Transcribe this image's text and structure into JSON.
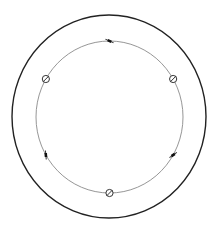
{
  "canvas": {
    "width": 219,
    "height": 229,
    "background": "#ffffff"
  },
  "outer_circle": {
    "cx": 109,
    "cy": 116.5,
    "rx": 97,
    "ry": 101.5,
    "stroke": "#222222",
    "stroke_width": 1.4
  },
  "inner_circle": {
    "cx": 109.5,
    "cy": 117,
    "rx": 73.5,
    "ry": 76,
    "stroke": "#8a8a8a",
    "stroke_width": 0.9
  },
  "markers": [
    {
      "type": "tick",
      "icon": "tick-mark-icon",
      "angle_deg": -90
    },
    {
      "type": "circle-slash",
      "icon": "circle-slash-icon",
      "angle_deg": -30
    },
    {
      "type": "tick",
      "icon": "tick-mark-icon",
      "angle_deg": 30
    },
    {
      "type": "circle-slash",
      "icon": "circle-slash-icon",
      "angle_deg": 90
    },
    {
      "type": "tick",
      "icon": "tick-mark-icon",
      "angle_deg": 150
    },
    {
      "type": "circle-slash",
      "icon": "circle-slash-icon",
      "angle_deg": 210
    }
  ],
  "marker_color": "#333333"
}
